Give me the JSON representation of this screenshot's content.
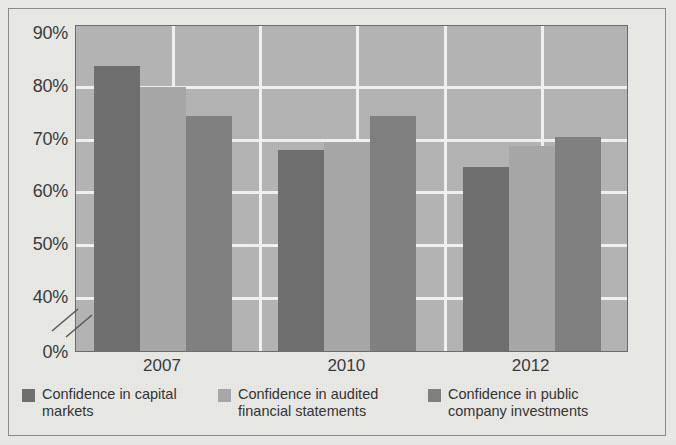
{
  "chart_data": {
    "type": "bar",
    "title": "",
    "subtitle": "",
    "xlabel": "",
    "ylabel": "",
    "categories": [
      "2007",
      "2010",
      "2012"
    ],
    "series": [
      {
        "name": "Confidence in capital markets",
        "color": "#6e6e6e",
        "values": [
          84,
          68,
          64.8
        ],
        "value_labels": [
          "84%",
          "68%",
          "64.8%"
        ]
      },
      {
        "name": "Confidence in audited financial statements",
        "color": "#a8a8a8",
        "values": [
          80,
          69.5,
          68.8
        ],
        "value_labels": [
          "80%",
          "69.5%",
          "68.8%"
        ]
      },
      {
        "name": "Confidence in public company investments",
        "color": "#808080",
        "values": [
          74.5,
          74.5,
          70.5
        ],
        "value_labels": [
          "74.5%",
          "74.5%",
          "70.5%"
        ]
      }
    ],
    "ylim": [
      0,
      90
    ],
    "y_axis_broken": true,
    "y_break_between": [
      0,
      40
    ],
    "y_tick_labels": [
      "90%",
      "80%",
      "70%",
      "60%",
      "50%",
      "40%",
      "0%"
    ],
    "y_tick_values": [
      90,
      80,
      70,
      60,
      50,
      40,
      0
    ],
    "gridlines": {
      "horizontal": true,
      "horizontal_at": [
        80,
        70,
        60,
        50,
        40
      ],
      "vertical": true,
      "color": "#f2f2f2"
    },
    "legend_position": "bottom",
    "plot_background": "#b4b4b4",
    "page_background": "#e9e9e6"
  },
  "y_axis": {
    "ticks": [
      {
        "label": "90%",
        "value": 90
      },
      {
        "label": "80%",
        "value": 80
      },
      {
        "label": "70%",
        "value": 70
      },
      {
        "label": "60%",
        "value": 60
      },
      {
        "label": "50%",
        "value": 50
      },
      {
        "label": "40%",
        "value": 40
      },
      {
        "label": "0%",
        "value": 0
      }
    ]
  },
  "x_axis": {
    "ticks": [
      {
        "label": "2007"
      },
      {
        "label": "2010"
      },
      {
        "label": "2012"
      }
    ]
  },
  "legend": {
    "items": [
      {
        "label": "Confidence in capital\nmarkets",
        "color": "#6e6e6e"
      },
      {
        "label": "Confidence in audited\nfinancial statements",
        "color": "#a8a8a8"
      },
      {
        "label": "Confidence in public\ncompany investments",
        "color": "#808080"
      }
    ]
  }
}
